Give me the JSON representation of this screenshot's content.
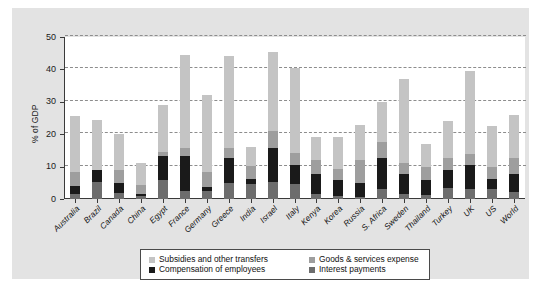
{
  "chart_data": {
    "type": "bar",
    "stacked": true,
    "title": "",
    "xlabel": "",
    "ylabel": "% of GDP",
    "ylim": [
      0,
      50
    ],
    "yticks": [
      0,
      10,
      20,
      30,
      40,
      50
    ],
    "grid": true,
    "legend_position": "bottom",
    "categories": [
      "Australia",
      "Brazil",
      "Canada",
      "China",
      "Egypt",
      "France",
      "Germany",
      "Greece",
      "India",
      "Israel",
      "Italy",
      "Kenya",
      "Korea",
      "Russia",
      "S. Africa",
      "Sweden",
      "Thailand",
      "Turkey",
      "UK",
      "US",
      "World"
    ],
    "series": [
      {
        "name": "Interest payments",
        "color": "#6d6d6d",
        "values": [
          1.4,
          5.2,
          2.0,
          0.8,
          6.0,
          2.6,
          2.4,
          5.0,
          4.6,
          5.3,
          4.6,
          1.6,
          1.0,
          0.6,
          3.0,
          1.6,
          1.2,
          3.4,
          3.0,
          3.0,
          2.2
        ]
      },
      {
        "name": "Compensation of employees",
        "color": "#1a1a1a",
        "values": [
          2.6,
          3.8,
          3.0,
          0.6,
          7.2,
          10.6,
          1.4,
          7.8,
          1.6,
          10.5,
          6.0,
          6.2,
          4.8,
          4.4,
          9.6,
          6.2,
          4.8,
          5.6,
          7.6,
          3.2,
          5.4
        ]
      },
      {
        "name": "Goods & services expense",
        "color": "#9e9e9e",
        "values": [
          4.2,
          0.0,
          4.0,
          3.0,
          1.4,
          2.6,
          4.6,
          3.0,
          4.0,
          5.2,
          3.6,
          4.2,
          3.6,
          7.0,
          5.0,
          3.4,
          4.0,
          3.6,
          3.2,
          3.6,
          5.0
        ]
      },
      {
        "name": "Subsidies and other transfers",
        "color": "#c4c4c4",
        "values": [
          17.3,
          15.5,
          11.0,
          6.6,
          14.4,
          28.7,
          23.6,
          28.2,
          5.8,
          24.5,
          26.3,
          7.0,
          9.6,
          11.0,
          12.4,
          25.8,
          7.0,
          11.4,
          25.7,
          12.7,
          13.4
        ]
      }
    ],
    "totals": [
      25.5,
      24.5,
      20.0,
      11.0,
      29.0,
      44.5,
      32.0,
      44.0,
      16.0,
      45.5,
      40.5,
      19.0,
      19.0,
      23.0,
      30.0,
      37.0,
      17.0,
      24.0,
      39.5,
      22.5,
      26.0
    ]
  },
  "legend": {
    "rows": [
      {
        "left": {
          "label": "Subsidies and other transfers",
          "color": "#c4c4c4"
        },
        "right": {
          "label": "Goods & services expense",
          "color": "#9e9e9e"
        }
      },
      {
        "left": {
          "label": "Compensation of employees",
          "color": "#1a1a1a"
        },
        "right": {
          "label": "Interest payments",
          "color": "#6d6d6d"
        }
      }
    ]
  },
  "colors": {
    "panel_background": "#e3e3e3",
    "plot_background": "#ffffff",
    "axis": "#3a3a3a",
    "gridline": "#8d8d8d"
  }
}
